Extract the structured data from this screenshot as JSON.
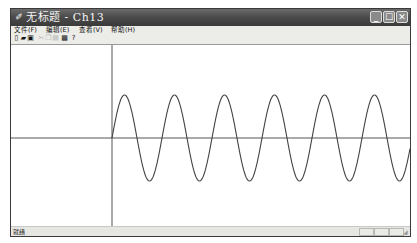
{
  "window": {
    "title": "无标题 - Ch13",
    "app_icon": "✐",
    "controls": {
      "minimize": "_",
      "maximize": "☐",
      "close": "✕"
    }
  },
  "menu": [
    {
      "label": "文件(F)"
    },
    {
      "label": "编辑(E)"
    },
    {
      "label": "查看(V)"
    },
    {
      "label": "帮助(H)"
    }
  ],
  "toolbar": [
    {
      "name": "new-icon",
      "glyph": "▯",
      "enabled": true
    },
    {
      "name": "open-icon",
      "glyph": "▰",
      "enabled": true
    },
    {
      "name": "save-icon",
      "glyph": "▣",
      "enabled": true
    },
    {
      "name": "cut-icon",
      "glyph": "✂",
      "enabled": false
    },
    {
      "name": "copy-icon",
      "glyph": "❐",
      "enabled": false
    },
    {
      "name": "paste-icon",
      "glyph": "▤",
      "enabled": false
    },
    {
      "name": "print-icon",
      "glyph": "▩",
      "enabled": true
    },
    {
      "name": "help-icon",
      "glyph": "?",
      "enabled": true
    }
  ],
  "canvas": {
    "plot": "sine wave",
    "axis_color": "#555555",
    "curve_color": "#444444"
  },
  "chart_data": {
    "type": "line",
    "title": "",
    "function": "sin(x)",
    "xlabel": "",
    "ylabel": "",
    "cycles_visible": 5.9,
    "amplitude": 1,
    "x_start": 0,
    "grid": false
  },
  "status": {
    "text": "就绪"
  }
}
